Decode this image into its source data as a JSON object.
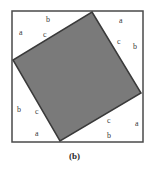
{
  "figure": {
    "caption": "(b)",
    "colors": {
      "outer_stroke": "#4a4a4a",
      "inner_fill": "#7a7a7a",
      "inner_stroke": "#3a3a3a",
      "label": "#3a3a3a"
    },
    "outer_square": {
      "x": 12,
      "y": 11,
      "size": 131
    },
    "inner_square_vertices": [
      [
        92,
        12
      ],
      [
        141,
        93
      ],
      [
        60,
        141
      ],
      [
        13,
        60
      ]
    ],
    "labels": [
      {
        "text": "b",
        "x": 46,
        "y": 22
      },
      {
        "text": "a",
        "x": 19,
        "y": 35
      },
      {
        "text": "c",
        "x": 43,
        "y": 37
      },
      {
        "text": "a",
        "x": 119,
        "y": 23
      },
      {
        "text": "c",
        "x": 117,
        "y": 44
      },
      {
        "text": "b",
        "x": 133,
        "y": 49
      },
      {
        "text": "b",
        "x": 17,
        "y": 112
      },
      {
        "text": "c",
        "x": 35,
        "y": 114
      },
      {
        "text": "a",
        "x": 35,
        "y": 136
      },
      {
        "text": "c",
        "x": 107,
        "y": 123
      },
      {
        "text": "a",
        "x": 135,
        "y": 126
      },
      {
        "text": "b",
        "x": 107,
        "y": 138
      }
    ]
  }
}
